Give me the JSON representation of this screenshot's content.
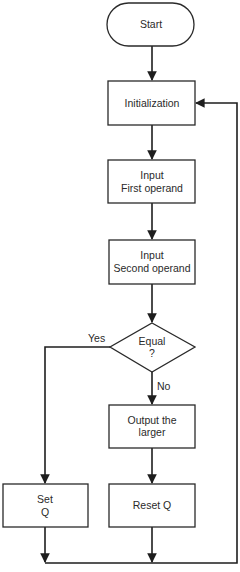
{
  "flowchart": {
    "nodes": {
      "start": {
        "type": "terminal",
        "lines": [
          "Start"
        ]
      },
      "init": {
        "type": "process",
        "lines": [
          "Initialization"
        ]
      },
      "input_first": {
        "type": "process",
        "lines": [
          "Input",
          "First operand"
        ]
      },
      "input_second": {
        "type": "process",
        "lines": [
          "Input",
          "Second operand"
        ]
      },
      "equal": {
        "type": "decision",
        "lines": [
          "Equal",
          "?"
        ]
      },
      "output_larger": {
        "type": "process",
        "lines": [
          "Output the",
          "larger"
        ]
      },
      "set_q": {
        "type": "process",
        "lines": [
          "Set",
          "Q"
        ]
      },
      "reset_q": {
        "type": "process",
        "lines": [
          "Reset Q"
        ]
      }
    },
    "edges": [
      {
        "from": "start",
        "to": "init",
        "label": ""
      },
      {
        "from": "init",
        "to": "input_first",
        "label": ""
      },
      {
        "from": "input_first",
        "to": "input_second",
        "label": ""
      },
      {
        "from": "input_second",
        "to": "equal",
        "label": ""
      },
      {
        "from": "equal",
        "to": "set_q",
        "label": "Yes"
      },
      {
        "from": "equal",
        "to": "output_larger",
        "label": "No"
      },
      {
        "from": "output_larger",
        "to": "reset_q",
        "label": ""
      },
      {
        "from": "set_q",
        "to": "init",
        "label": ""
      },
      {
        "from": "reset_q",
        "to": "init",
        "label": ""
      }
    ],
    "edge_labels": {
      "yes": "Yes",
      "no": "No"
    }
  }
}
